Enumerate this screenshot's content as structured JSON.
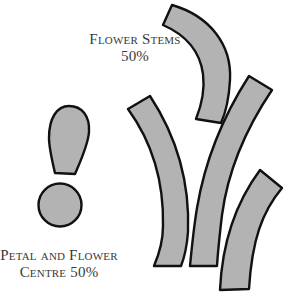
{
  "diagram": {
    "colors": {
      "fill": "#b3b3b3",
      "stroke": "#111111",
      "text": "#3a3a3a",
      "background": "#ffffff"
    },
    "labels": {
      "stems": {
        "line1": "Flower Stems",
        "line2": "50%"
      },
      "petal": {
        "line1": "Petal and Flower",
        "line2": "Centre 50%"
      }
    },
    "pieces": [
      {
        "name": "flower-stem-1",
        "group": "stems"
      },
      {
        "name": "flower-stem-2",
        "group": "stems"
      },
      {
        "name": "flower-stem-3",
        "group": "stems"
      },
      {
        "name": "flower-stem-4",
        "group": "stems"
      },
      {
        "name": "petal",
        "group": "petal"
      },
      {
        "name": "flower-centre",
        "group": "petal"
      }
    ]
  }
}
